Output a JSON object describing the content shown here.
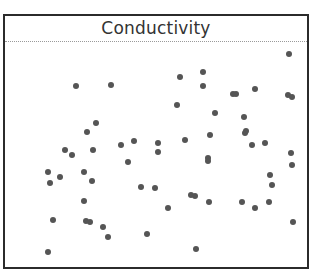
{
  "chart_data": {
    "type": "scatter",
    "title": "Conductivity",
    "xlabel": "",
    "ylabel": "",
    "grid": false,
    "legend": null,
    "axes_visible": false,
    "marker_color": "#555555",
    "frame": {
      "left": 3,
      "top": 14,
      "right": 307,
      "bottom": 267
    },
    "points": [
      {
        "x": 76,
        "y": 86
      },
      {
        "x": 111,
        "y": 85
      },
      {
        "x": 289,
        "y": 54
      },
      {
        "x": 180,
        "y": 77
      },
      {
        "x": 203,
        "y": 72
      },
      {
        "x": 203,
        "y": 86
      },
      {
        "x": 233,
        "y": 94
      },
      {
        "x": 236,
        "y": 94
      },
      {
        "x": 255,
        "y": 89
      },
      {
        "x": 288,
        "y": 95
      },
      {
        "x": 292,
        "y": 97
      },
      {
        "x": 177,
        "y": 105
      },
      {
        "x": 215,
        "y": 113
      },
      {
        "x": 244,
        "y": 117
      },
      {
        "x": 96,
        "y": 123
      },
      {
        "x": 87,
        "y": 132
      },
      {
        "x": 210,
        "y": 135
      },
      {
        "x": 245,
        "y": 133
      },
      {
        "x": 246,
        "y": 131
      },
      {
        "x": 252,
        "y": 145
      },
      {
        "x": 185,
        "y": 140
      },
      {
        "x": 265,
        "y": 143
      },
      {
        "x": 65,
        "y": 150
      },
      {
        "x": 72,
        "y": 155
      },
      {
        "x": 93,
        "y": 150
      },
      {
        "x": 121,
        "y": 145
      },
      {
        "x": 134,
        "y": 141
      },
      {
        "x": 158,
        "y": 143
      },
      {
        "x": 158,
        "y": 152
      },
      {
        "x": 128,
        "y": 162
      },
      {
        "x": 48,
        "y": 172
      },
      {
        "x": 50,
        "y": 183
      },
      {
        "x": 60,
        "y": 177
      },
      {
        "x": 84,
        "y": 172
      },
      {
        "x": 92,
        "y": 181
      },
      {
        "x": 291,
        "y": 153
      },
      {
        "x": 292,
        "y": 165
      },
      {
        "x": 270,
        "y": 175
      },
      {
        "x": 272,
        "y": 185
      },
      {
        "x": 141,
        "y": 187
      },
      {
        "x": 155,
        "y": 188
      },
      {
        "x": 208,
        "y": 158
      },
      {
        "x": 208,
        "y": 161
      },
      {
        "x": 191,
        "y": 195
      },
      {
        "x": 195,
        "y": 196
      },
      {
        "x": 209,
        "y": 202
      },
      {
        "x": 242,
        "y": 202
      },
      {
        "x": 255,
        "y": 208
      },
      {
        "x": 269,
        "y": 202
      },
      {
        "x": 84,
        "y": 201
      },
      {
        "x": 86,
        "y": 221
      },
      {
        "x": 90,
        "y": 222
      },
      {
        "x": 103,
        "y": 227
      },
      {
        "x": 108,
        "y": 237
      },
      {
        "x": 53,
        "y": 220
      },
      {
        "x": 147,
        "y": 234
      },
      {
        "x": 293,
        "y": 222
      },
      {
        "x": 48,
        "y": 252
      },
      {
        "x": 196,
        "y": 249
      },
      {
        "x": 168,
        "y": 208
      }
    ]
  }
}
